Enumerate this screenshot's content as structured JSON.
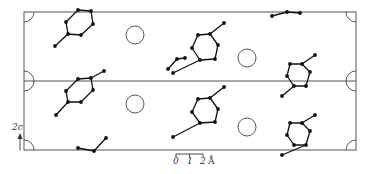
{
  "diagram": {
    "type": "crystal-structure-projection",
    "axis_label": "2c",
    "scale_bar": {
      "ticks": [
        "0",
        "1",
        "2"
      ],
      "unit": "Å"
    },
    "colors": {
      "line": "#555555",
      "atom": "#111111",
      "background": "#ffffff"
    },
    "cells": [
      "upper-cell",
      "lower-cell"
    ],
    "circles": [
      {
        "id": "circle-1",
        "cell": "upper",
        "position": "left-center"
      },
      {
        "id": "circle-2",
        "cell": "upper",
        "position": "right-center"
      },
      {
        "id": "circle-3",
        "cell": "lower",
        "position": "left-center"
      },
      {
        "id": "circle-4",
        "cell": "lower",
        "position": "right-center"
      }
    ],
    "molecule_count": 8
  }
}
